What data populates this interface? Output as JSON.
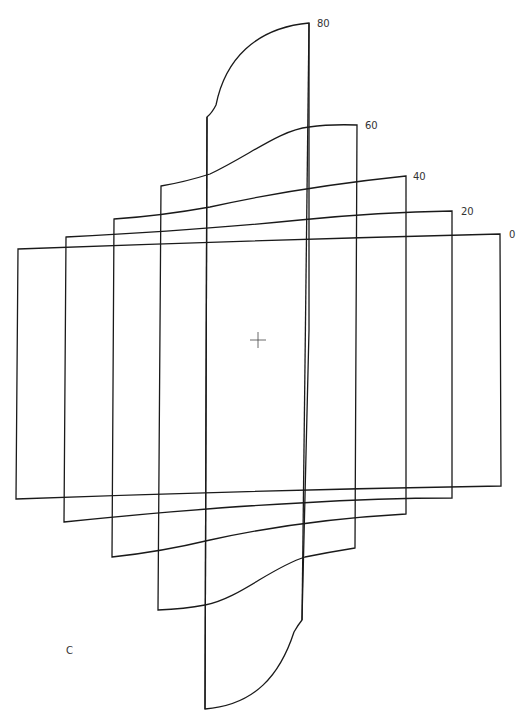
{
  "diagram": {
    "type": "nested distorted frame outlines",
    "stroke_color": "#1a1a1a",
    "background": "#ffffff",
    "frames": [
      {
        "label": "0",
        "path": "M16,499 L18,249 Q260,240 500,234 L501,486 Q260,490 16,499 Z",
        "label_x": 509,
        "label_y": 238
      },
      {
        "label": "20",
        "path": "M64,522 L66,237 Q200,230 300,220 Q380,212 452,211 L452,498 Q380,498 300,503 Q200,508 64,522 Z",
        "label_x": 461,
        "label_y": 215
      },
      {
        "label": "40",
        "path": "M112,557 L114,219 Q160,216 210,207 Q300,187 406,176 L406,514 Q300,520 210,540 Q160,552 112,557 Z",
        "label_x": 413,
        "label_y": 180
      },
      {
        "label": "60",
        "path": "M158,610 L161,186 Q185,182 210,174 C250,155 280,130 309,127 Q330,124 357,125 L355,548 Q330,552 305,557 C270,568 240,598 205,605 Q185,609 158,610 Z",
        "label_x": 365,
        "label_y": 129
      },
      {
        "label": "80",
        "path": "M205,709 L207,117 Q212,113 216,105 C225,60 255,28 309,23 L309,330 L302,620 Q298,625 294,632 C280,675 255,705 205,709 Z",
        "label_x": 317,
        "label_y": 27
      }
    ],
    "inner_verticals": [
      {
        "name": "frame-80-left-edge",
        "x1": 207,
        "y1": 117,
        "x2": 205,
        "y2": 709
      },
      {
        "name": "frame-80-right-edge",
        "x1": 309,
        "y1": 23,
        "x2": 302,
        "y2": 620
      }
    ],
    "crosshair": {
      "cx": 258,
      "cy": 340,
      "size": 8
    },
    "corner_label": {
      "text": "C",
      "x": 66,
      "y": 654
    }
  }
}
